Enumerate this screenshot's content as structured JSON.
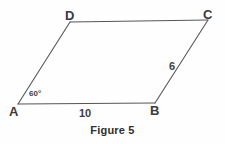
{
  "figure": {
    "caption": "Figure 5",
    "shape_name": "parallelogram",
    "line_color": "#55565a",
    "text_color": "#3a3a3a",
    "background": "#fefefe"
  },
  "vertices": [
    {
      "id": "A",
      "label": "A",
      "x": 18,
      "y": 104,
      "label_x": 9,
      "label_y": 105
    },
    {
      "id": "B",
      "label": "B",
      "x": 155,
      "y": 103,
      "label_x": 150,
      "label_y": 104
    },
    {
      "id": "C",
      "label": "C",
      "x": 208,
      "y": 20,
      "label_x": 203,
      "label_y": 8
    },
    {
      "id": "D",
      "label": "D",
      "x": 70,
      "y": 22,
      "label_x": 65,
      "label_y": 9
    }
  ],
  "edges": [
    {
      "id": "AB",
      "from": "A",
      "to": "B"
    },
    {
      "id": "BC",
      "from": "B",
      "to": "C"
    },
    {
      "id": "CD",
      "from": "C",
      "to": "D"
    },
    {
      "id": "DA",
      "from": "D",
      "to": "A"
    }
  ],
  "measurements": [
    {
      "id": "side-ab",
      "edge": "AB",
      "value": "10",
      "x": 79,
      "y": 108
    },
    {
      "id": "side-bc",
      "edge": "BC",
      "value": "6",
      "x": 169,
      "y": 61
    }
  ],
  "angles": [
    {
      "id": "angle-a",
      "vertex": "A",
      "value": "60",
      "unit": "°",
      "x": 29,
      "y": 90
    }
  ]
}
